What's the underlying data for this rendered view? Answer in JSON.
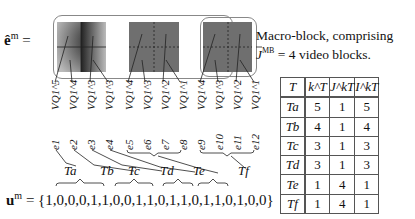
{
  "figure": {
    "lhs_e": "ê",
    "lhs_e_sup": "m",
    "equals": "=",
    "note_line1": "Macro-block, comprising",
    "note_line2_pre": "J",
    "note_line2_sup": "MB",
    "note_line2_post": " = 4 video blocks.",
    "quant_labels": [
      "VQ1^5",
      "VQ1^4",
      "VQ1^3",
      "VQ1^3",
      "VQ1^4",
      "VQ1^3",
      "VQ1^2",
      "VQ1^1",
      "VQ1^4",
      "VQ1^3",
      "VQ1^2",
      "VQ1^1"
    ],
    "e_labels": [
      "e1",
      "e2",
      "e3",
      "e4",
      "e5",
      "e6",
      "e7",
      "e8",
      "e9",
      "e10",
      "e11",
      "e12"
    ],
    "groups": [
      "Ta",
      "Tb",
      "Tc",
      "Td",
      "Te",
      "Tf"
    ],
    "u_label": "u",
    "u_sup": "m",
    "u_sequence": "{1,0,0,0,1,1,0,0,1,1,0,1,1,0,1,1,0,1,0,0}"
  },
  "table": {
    "headers": [
      "T",
      "k^T",
      "J^kT",
      "I^kT"
    ],
    "rows": [
      {
        "T": "Ta",
        "k": "5",
        "J": "1",
        "I": "5"
      },
      {
        "T": "Tb",
        "k": "4",
        "J": "1",
        "I": "4"
      },
      {
        "T": "Tc",
        "k": "3",
        "J": "1",
        "I": "3"
      },
      {
        "T": "Td",
        "k": "3",
        "J": "1",
        "I": "3"
      },
      {
        "T": "Te",
        "k": "1",
        "J": "4",
        "I": "1"
      },
      {
        "T": "Tf",
        "k": "1",
        "J": "4",
        "I": "1"
      }
    ]
  },
  "colors": {
    "frame": "#888888",
    "block_gray": "#6f6f6f",
    "text": "#111111"
  }
}
